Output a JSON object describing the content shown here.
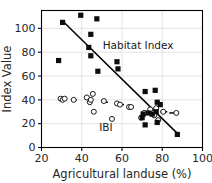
{
  "chart_data": {
    "type": "scatter",
    "title": "",
    "xlabel": "Agricultural landuse (%)",
    "ylabel": "Index Value",
    "xlim": [
      20,
      100
    ],
    "ylim": [
      0,
      115
    ],
    "xticks": [
      20,
      40,
      60,
      80,
      100
    ],
    "yticks": [
      0,
      20,
      40,
      60,
      80,
      100
    ],
    "xtick_labels": [
      "20",
      "40",
      "60",
      "80",
      "100"
    ],
    "ytick_labels": [
      "0",
      "20",
      "40",
      "60",
      "80",
      "100"
    ],
    "grid": true,
    "grid_color": "#d9d9d9",
    "legend_position": "in-plot-annotations",
    "annotations": [
      {
        "text": "Habitat Index",
        "x": 68,
        "y": 83
      },
      {
        "text": "IBI",
        "x": 52,
        "y": 14
      }
    ],
    "series": [
      {
        "name": "Habitat Index",
        "marker": "filled-square",
        "color": "#0d0d0d",
        "points": [
          {
            "x": 28.5,
            "y": 73
          },
          {
            "x": 30.5,
            "y": 105
          },
          {
            "x": 39.5,
            "y": 111
          },
          {
            "x": 43.5,
            "y": 84
          },
          {
            "x": 44.5,
            "y": 95
          },
          {
            "x": 44.5,
            "y": 77
          },
          {
            "x": 47.5,
            "y": 108
          },
          {
            "x": 48.0,
            "y": 64
          },
          {
            "x": 57.5,
            "y": 72
          },
          {
            "x": 58.0,
            "y": 66
          },
          {
            "x": 71.5,
            "y": 47
          },
          {
            "x": 71.5,
            "y": 19
          },
          {
            "x": 70.0,
            "y": 25
          },
          {
            "x": 70.5,
            "y": 28
          },
          {
            "x": 76.5,
            "y": 48
          },
          {
            "x": 77.5,
            "y": 38
          },
          {
            "x": 77.0,
            "y": 30
          },
          {
            "x": 77.5,
            "y": 21
          },
          {
            "x": 79.0,
            "y": 36
          },
          {
            "x": 75.0,
            "y": 28
          },
          {
            "x": 73.0,
            "y": 29
          },
          {
            "x": 87.5,
            "y": 11
          }
        ]
      },
      {
        "name": "IBI",
        "marker": "open-circle",
        "color": "#1a1a1a",
        "points": [
          {
            "x": 29.5,
            "y": 41
          },
          {
            "x": 30.5,
            "y": 40
          },
          {
            "x": 31.5,
            "y": 41
          },
          {
            "x": 36.0,
            "y": 40
          },
          {
            "x": 42.5,
            "y": 42
          },
          {
            "x": 44.0,
            "y": 38
          },
          {
            "x": 44.5,
            "y": 40
          },
          {
            "x": 45.5,
            "y": 45
          },
          {
            "x": 46.0,
            "y": 30
          },
          {
            "x": 51.0,
            "y": 39
          },
          {
            "x": 55.0,
            "y": 24
          },
          {
            "x": 57.5,
            "y": 37
          },
          {
            "x": 59.0,
            "y": 36
          },
          {
            "x": 63.5,
            "y": 34
          },
          {
            "x": 64.5,
            "y": 34
          },
          {
            "x": 69.5,
            "y": 25
          },
          {
            "x": 71.0,
            "y": 29
          },
          {
            "x": 74.0,
            "y": 32
          },
          {
            "x": 75.5,
            "y": 29
          },
          {
            "x": 76.0,
            "y": 27
          },
          {
            "x": 77.0,
            "y": 33
          },
          {
            "x": 78.0,
            "y": 23
          },
          {
            "x": 80.5,
            "y": 30
          },
          {
            "x": 87.0,
            "y": 29
          }
        ]
      }
    ],
    "trendlines": [
      {
        "name": "habitat-index-regression",
        "x0": 30.0,
        "y0": 107,
        "x1": 88.0,
        "y1": 11
      },
      {
        "name": "ibi-regression-dashed-left",
        "x0": 35.0,
        "y0": 40,
        "x1": 37.5,
        "y1": 40,
        "style": "dash"
      },
      {
        "name": "ibi-regression-dashed-mid",
        "x0": 50.0,
        "y0": 38,
        "x1": 53.0,
        "y1": 38,
        "style": "dash"
      },
      {
        "name": "ibi-regression-dashed-mid2",
        "x0": 58.5,
        "y0": 36,
        "x1": 61.0,
        "y1": 36,
        "style": "dash"
      },
      {
        "name": "ibi-regression-dashed-right",
        "x0": 79.0,
        "y0": 30,
        "x1": 82.5,
        "y1": 30,
        "style": "dash"
      },
      {
        "name": "ibi-regression-dashed-far-right",
        "x0": 83.5,
        "y0": 29,
        "x1": 86.0,
        "y1": 29,
        "style": "dash"
      }
    ]
  }
}
